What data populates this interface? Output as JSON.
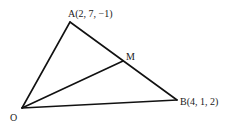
{
  "diagram": {
    "points": {
      "A": {
        "name": "A",
        "label": "A(2, 7, −1)",
        "x": 70,
        "y": 22
      },
      "B": {
        "name": "B",
        "label": "B(4, 1, 2)",
        "x": 177,
        "y": 100
      },
      "M": {
        "name": "M",
        "label": "M",
        "x": 123,
        "y": 61
      },
      "O": {
        "name": "O",
        "label": "O",
        "x": 22,
        "y": 108
      }
    },
    "segments": [
      {
        "from": "O",
        "to": "A"
      },
      {
        "from": "A",
        "to": "B"
      },
      {
        "from": "O",
        "to": "B"
      },
      {
        "from": "O",
        "to": "M"
      }
    ],
    "line_color": "#111111"
  }
}
